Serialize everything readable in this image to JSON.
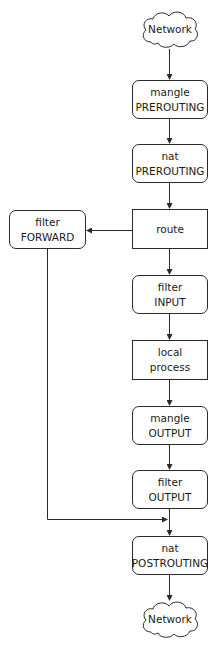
{
  "diagram": {
    "type": "flowchart",
    "colors": {
      "line": "#2a2a2a",
      "background": "#ffffff",
      "text": "#1a1a1a"
    },
    "nodes": {
      "network_in": {
        "label": "Network",
        "shape": "cloud"
      },
      "mangle_prerouting": {
        "line1": "mangle",
        "line2": "PREROUTING",
        "shape": "rounded"
      },
      "nat_prerouting": {
        "line1": "nat",
        "line2": "PREROUTING",
        "shape": "rounded"
      },
      "route": {
        "label": "route",
        "shape": "rect"
      },
      "filter_forward": {
        "line1": "filter",
        "line2": "FORWARD",
        "shape": "rounded"
      },
      "filter_input": {
        "line1": "filter",
        "line2": "INPUT",
        "shape": "rounded"
      },
      "local_process": {
        "line1": "local",
        "line2": "process",
        "shape": "rect"
      },
      "mangle_output": {
        "line1": "mangle",
        "line2": "OUTPUT",
        "shape": "rounded"
      },
      "filter_output": {
        "line1": "filter",
        "line2": "OUTPUT",
        "shape": "rounded"
      },
      "nat_postrouting": {
        "line1": "nat",
        "line2": "POSTROUTING",
        "shape": "rounded"
      },
      "network_out": {
        "label": "Network",
        "shape": "cloud"
      }
    },
    "edges": [
      {
        "from": "Network",
        "to": "mangle PREROUTING"
      },
      {
        "from": "mangle PREROUTING",
        "to": "nat PREROUTING"
      },
      {
        "from": "nat PREROUTING",
        "to": "route"
      },
      {
        "from": "route",
        "to": "filter FORWARD"
      },
      {
        "from": "route",
        "to": "filter INPUT"
      },
      {
        "from": "filter INPUT",
        "to": "local process"
      },
      {
        "from": "local process",
        "to": "mangle OUTPUT"
      },
      {
        "from": "mangle OUTPUT",
        "to": "filter OUTPUT"
      },
      {
        "from": "filter OUTPUT",
        "to": "nat POSTROUTING"
      },
      {
        "from": "filter FORWARD",
        "to": "nat POSTROUTING"
      },
      {
        "from": "nat POSTROUTING",
        "to": "Network"
      }
    ]
  }
}
